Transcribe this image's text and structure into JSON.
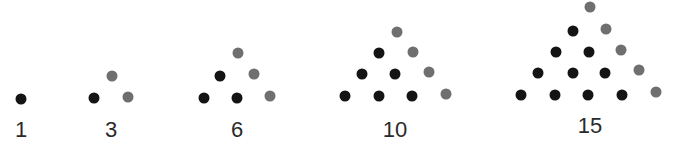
{
  "colors": {
    "base_dot": "#141414",
    "new_dot": "#6f6f6f",
    "label": "#2a2a2a"
  },
  "chart_data": {
    "type": "scatter",
    "categories": [
      "1",
      "3",
      "6",
      "10",
      "15"
    ],
    "values": [
      1,
      3,
      6,
      10,
      15
    ],
    "legend": [
      {
        "name": "previous triangle",
        "color": "#141414"
      },
      {
        "name": "added diagonal",
        "color": "#6f6f6f"
      }
    ]
  },
  "figures": [
    {
      "label": "1",
      "label_x": 21,
      "label_y": 119,
      "dots": [
        {
          "x": 21,
          "y": 99,
          "k": "b"
        }
      ]
    },
    {
      "label": "3",
      "label_x": 111,
      "label_y": 119,
      "dots": [
        {
          "x": 94,
          "y": 98,
          "k": "b"
        },
        {
          "x": 112,
          "y": 76,
          "k": "g"
        },
        {
          "x": 128,
          "y": 97,
          "k": "g"
        }
      ]
    },
    {
      "label": "6",
      "label_x": 237,
      "label_y": 119,
      "dots": [
        {
          "x": 204,
          "y": 98,
          "k": "b"
        },
        {
          "x": 237,
          "y": 98,
          "k": "b"
        },
        {
          "x": 270,
          "y": 96,
          "k": "g"
        },
        {
          "x": 220,
          "y": 76,
          "k": "b"
        },
        {
          "x": 254,
          "y": 74,
          "k": "g"
        },
        {
          "x": 238,
          "y": 53,
          "k": "g"
        }
      ]
    },
    {
      "label": "10",
      "label_x": 395,
      "label_y": 119,
      "dots": [
        {
          "x": 345,
          "y": 96,
          "k": "b"
        },
        {
          "x": 379,
          "y": 96,
          "k": "b"
        },
        {
          "x": 412,
          "y": 96,
          "k": "b"
        },
        {
          "x": 446,
          "y": 94,
          "k": "g"
        },
        {
          "x": 362,
          "y": 74,
          "k": "b"
        },
        {
          "x": 395,
          "y": 74,
          "k": "b"
        },
        {
          "x": 429,
          "y": 72,
          "k": "g"
        },
        {
          "x": 379,
          "y": 53,
          "k": "b"
        },
        {
          "x": 413,
          "y": 52,
          "k": "g"
        },
        {
          "x": 397,
          "y": 32,
          "k": "g"
        }
      ]
    },
    {
      "label": "15",
      "label_x": 590,
      "label_y": 115,
      "dots": [
        {
          "x": 521,
          "y": 95,
          "k": "b"
        },
        {
          "x": 555,
          "y": 95,
          "k": "b"
        },
        {
          "x": 588,
          "y": 95,
          "k": "b"
        },
        {
          "x": 622,
          "y": 95,
          "k": "b"
        },
        {
          "x": 656,
          "y": 92,
          "k": "g"
        },
        {
          "x": 538,
          "y": 73,
          "k": "b"
        },
        {
          "x": 573,
          "y": 73,
          "k": "b"
        },
        {
          "x": 605,
          "y": 73,
          "k": "b"
        },
        {
          "x": 639,
          "y": 70,
          "k": "g"
        },
        {
          "x": 556,
          "y": 52,
          "k": "b"
        },
        {
          "x": 589,
          "y": 52,
          "k": "b"
        },
        {
          "x": 621,
          "y": 50,
          "k": "g"
        },
        {
          "x": 573,
          "y": 31,
          "k": "b"
        },
        {
          "x": 606,
          "y": 29,
          "k": "g"
        },
        {
          "x": 590,
          "y": 7,
          "k": "g"
        }
      ]
    }
  ]
}
